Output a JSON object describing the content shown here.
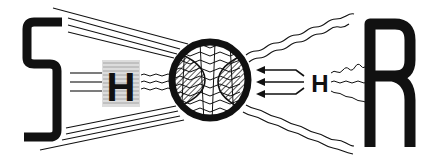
{
  "diagram": {
    "left_letter": "S",
    "right_letter": "R",
    "left_mid_label": "H",
    "right_mid_label": "H",
    "ink_color": "#111111",
    "background": "#ffffff",
    "central_element": "hatched-circle",
    "left_flow": "straight-lines-converging",
    "right_flow": "wavy-lines-converging",
    "right_arrows": 3
  }
}
